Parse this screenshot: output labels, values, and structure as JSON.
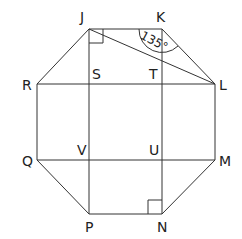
{
  "diagram": {
    "type": "octagon-geometry",
    "points": {
      "J": {
        "label": "J"
      },
      "K": {
        "label": "K"
      },
      "L": {
        "label": "L"
      },
      "M": {
        "label": "M"
      },
      "N": {
        "label": "N"
      },
      "P": {
        "label": "P"
      },
      "Q": {
        "label": "Q"
      },
      "R": {
        "label": "R"
      },
      "S": {
        "label": "S"
      },
      "T": {
        "label": "T"
      },
      "U": {
        "label": "U"
      },
      "V": {
        "label": "V"
      }
    },
    "angle_label": "135°",
    "right_angles": [
      "J",
      "N"
    ],
    "line_color": "#333333"
  }
}
